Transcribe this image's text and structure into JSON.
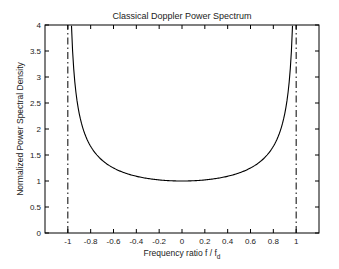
{
  "chart_data": {
    "type": "line",
    "title": "Classical Doppler Power Spectrum",
    "xlabel": "Frequency ratio f / f_d",
    "xlabel_main": "Frequency ratio f / f",
    "xlabel_sub": "d",
    "ylabel": "Normalized Power Spectral Density",
    "xlim": [
      -1.2,
      1.2
    ],
    "ylim": [
      0,
      4
    ],
    "grid": false,
    "legend": null,
    "x_ticks": [
      -1,
      -0.8,
      -0.6,
      -0.4,
      -0.2,
      0,
      0.2,
      0.4,
      0.6,
      0.8,
      1
    ],
    "x_tick_labels": [
      "-1",
      "-0.8",
      "-0.6",
      "-0.4",
      "-0.2",
      "0",
      "0.2",
      "0.4",
      "0.6",
      "0.8",
      "1"
    ],
    "y_ticks": [
      0,
      0.5,
      1,
      1.5,
      2,
      2.5,
      3,
      3.5,
      4
    ],
    "y_tick_labels": [
      "0",
      "0.5",
      "1",
      "1.5",
      "2",
      "2.5",
      "3",
      "3.5",
      "4"
    ],
    "series": [
      {
        "name": "S(f) = 1/sqrt(1 - (f/fd)^2)",
        "style": "solid",
        "color": "#000000",
        "x": [
          -0.968,
          -0.96,
          -0.95,
          -0.94,
          -0.92,
          -0.9,
          -0.85,
          -0.8,
          -0.75,
          -0.7,
          -0.6,
          -0.5,
          -0.4,
          -0.3,
          -0.2,
          -0.1,
          0,
          0.1,
          0.2,
          0.3,
          0.4,
          0.5,
          0.6,
          0.7,
          0.75,
          0.8,
          0.85,
          0.9,
          0.92,
          0.94,
          0.95,
          0.96,
          0.968
        ],
        "y": [
          3.99,
          3.57,
          3.2,
          2.93,
          2.55,
          2.29,
          1.9,
          1.67,
          1.51,
          1.4,
          1.25,
          1.15,
          1.09,
          1.05,
          1.02,
          1.005,
          1.0,
          1.005,
          1.02,
          1.05,
          1.09,
          1.15,
          1.25,
          1.4,
          1.51,
          1.67,
          1.9,
          2.29,
          2.55,
          2.93,
          3.2,
          3.57,
          3.99
        ]
      },
      {
        "name": "Left Doppler limit",
        "style": "dash-dot",
        "color": "#000000",
        "x": [
          -1,
          -1
        ],
        "y": [
          0,
          4
        ]
      },
      {
        "name": "Right Doppler limit",
        "style": "dash-dot",
        "color": "#000000",
        "x": [
          1,
          1
        ],
        "y": [
          0,
          4
        ]
      }
    ]
  }
}
